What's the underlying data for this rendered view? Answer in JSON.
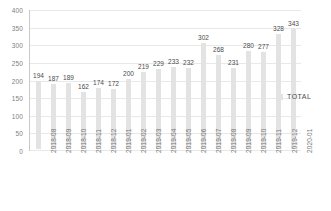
{
  "chart_data": {
    "type": "bar",
    "title": "",
    "subtitle": "",
    "xlabel": "",
    "ylabel": "",
    "ylim": [
      0,
      400
    ],
    "yticks": [
      0,
      50,
      100,
      150,
      200,
      250,
      300,
      350,
      400
    ],
    "grid": true,
    "legend_position": "right",
    "legend": [
      "TOTAL"
    ],
    "series_name": "TOTAL",
    "bar_color": "#e3e3e3",
    "categories": [
      "2018-08",
      "2018-09",
      "2018-10",
      "2018-11",
      "2018-12",
      "2019-01",
      "2019-02",
      "2019-03",
      "2019-04",
      "2019-05",
      "2019-06",
      "2019-07",
      "2019-08",
      "2019-09",
      "2019-10",
      "2019-11",
      "2019-12",
      "2020-01"
    ],
    "values": [
      194,
      187,
      189,
      162,
      174,
      172,
      200,
      219,
      229,
      233,
      232,
      302,
      268,
      231,
      280,
      277,
      328,
      343
    ],
    "data_labels": [
      "194",
      "187",
      "189",
      "162",
      "174",
      "172",
      "200",
      "219",
      "229",
      "233",
      "232",
      "302",
      "268",
      "231",
      "280",
      "277",
      "328",
      "343"
    ],
    "ytick_labels": [
      "400",
      "350",
      "300",
      "250",
      "200",
      "150",
      "100",
      "50",
      "0"
    ]
  },
  "legend": {
    "total_label": "TOTAL"
  },
  "colors": {
    "bar": "#e3e3e3",
    "grid": "#e8e8e8",
    "axis": "#c9c9c9",
    "tick_text": "#808080",
    "label_text": "#4a4a4a"
  }
}
